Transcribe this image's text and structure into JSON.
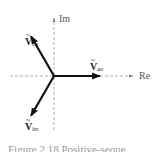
{
  "diagram": {
    "type": "phasor-diagram",
    "axes": {
      "real_label": "Re",
      "imag_label": "Im"
    },
    "phasors": [
      {
        "name": "an",
        "symbol": "V",
        "subscript": "an",
        "angle_deg": 0,
        "magnitude": 1
      },
      {
        "name": "bn",
        "symbol": "V",
        "subscript": "bn",
        "angle_deg": -120,
        "magnitude": 1
      },
      {
        "name": "cn",
        "symbol": "V",
        "subscript": "cn",
        "angle_deg": 120,
        "magnitude": 1
      }
    ],
    "caption": "Figure 2.18 Positive-seque"
  }
}
